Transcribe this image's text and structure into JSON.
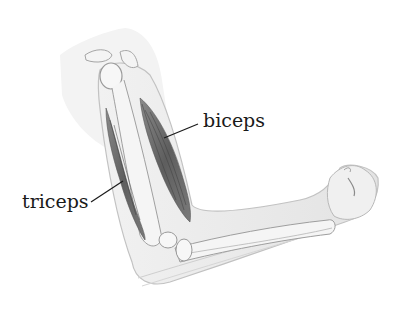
{
  "diagram": {
    "labels": [
      {
        "id": "biceps",
        "text": "biceps"
      },
      {
        "id": "triceps",
        "text": "triceps"
      }
    ],
    "colors": {
      "background": "#ffffff",
      "skin": "#ececec",
      "skin_outline": "#bdbdbd",
      "bone": "#f6f6f6",
      "bone_outline": "#9a9a9a",
      "muscle": "#6e6e6e",
      "muscle_dark": "#4a4a4a",
      "text": "#1a1a1a",
      "leader_line": "#1a1a1a"
    }
  }
}
